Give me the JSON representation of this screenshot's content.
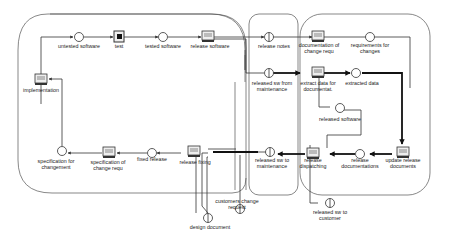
{
  "diagram": {
    "type": "petri-net-process-model",
    "regions": [
      {
        "id": "development",
        "name": "development-area"
      },
      {
        "id": "interface",
        "name": "interface-area"
      },
      {
        "id": "maintenance",
        "name": "maintenance-area"
      }
    ],
    "transitions": [
      {
        "id": "implementation",
        "label": "implementation"
      },
      {
        "id": "test",
        "label": "test"
      },
      {
        "id": "release_software",
        "label": "release software"
      },
      {
        "id": "documentation_of_change_requ",
        "label": "documentation of\nchange requ"
      },
      {
        "id": "extract_data",
        "label": "extract data for\ndocumentat."
      },
      {
        "id": "update_release_documents",
        "label": "update release\ndocuments"
      },
      {
        "id": "release_dispatching",
        "label": "release\ndispatching"
      },
      {
        "id": "release_fixing",
        "label": "release fixing"
      },
      {
        "id": "specification_of_change_requ",
        "label": "specification of\nchange requ"
      }
    ],
    "places": [
      {
        "id": "untested_software",
        "label": "untested software"
      },
      {
        "id": "tested_software",
        "label": "tested software"
      },
      {
        "id": "requirements_for_changes",
        "label": "requirements for\nchanges"
      },
      {
        "id": "extracted_data",
        "label": "extracted data"
      },
      {
        "id": "released_software",
        "label": "released software"
      },
      {
        "id": "release_documentations",
        "label": "release\ndocumentations"
      },
      {
        "id": "fixed_release",
        "label": "fixed release"
      },
      {
        "id": "specification_for_changement",
        "label": "specification for\nchangement"
      }
    ],
    "interface_places": [
      {
        "id": "release_notes",
        "label": "release notes"
      },
      {
        "id": "released_sw_from_maintenance",
        "label": "released sw from\nmaintenance"
      },
      {
        "id": "released_sw_to_maintenance",
        "label": "released sw to\nmaintenance"
      },
      {
        "id": "customers_change_request",
        "label": "customers change\nrequest"
      },
      {
        "id": "design_document",
        "label": "design document"
      },
      {
        "id": "released_sw_to_customer",
        "label": "released sw to\ncustomer"
      }
    ],
    "colors": {
      "line": "#333333",
      "thick_line": "#111111",
      "background": "#ffffff"
    }
  }
}
